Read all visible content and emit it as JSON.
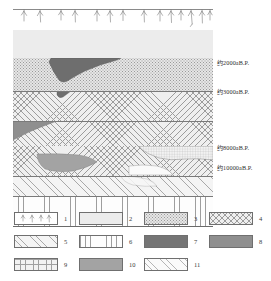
{
  "diagram": {
    "title": "",
    "type": "geological-stratigraphic-cross-section",
    "horizon_labels": [
      {
        "id": "h2000",
        "text": "约2000aB.P.",
        "top": 61
      },
      {
        "id": "h3000",
        "text": "约3000aB.P.",
        "top": 90
      },
      {
        "id": "h8000",
        "text": "约8000aB.P.",
        "top": 146
      },
      {
        "id": "h10000",
        "text": "约10000aB.P.",
        "top": 166
      }
    ],
    "surface": {
      "name": "vegetation-surface-line",
      "symbol_count": 14
    },
    "layers": [
      {
        "id": "L1",
        "pattern": "plain",
        "top": 0,
        "height": 28,
        "label": "2"
      },
      {
        "id": "L2",
        "pattern": "stipple",
        "top": 28,
        "height": 33,
        "label": "3"
      },
      {
        "id": "L3",
        "pattern": "xhatch",
        "top": 61,
        "height": 30,
        "label": "4"
      },
      {
        "id": "L4",
        "pattern": "xhatch",
        "top": 91,
        "height": 25,
        "label": "4"
      },
      {
        "id": "L5",
        "pattern": "xhatch",
        "top": 116,
        "height": 30,
        "label": "4"
      },
      {
        "id": "L6",
        "pattern": "dhatch",
        "top": 146,
        "height": 20,
        "label": "5"
      },
      {
        "id": "L7",
        "pattern": "vline",
        "top": 166,
        "height": 30,
        "label": "6"
      }
    ],
    "bodies": [
      {
        "id": "B1",
        "pattern": "solid-dark",
        "note": "dark lens in stipple layer"
      },
      {
        "id": "B2",
        "pattern": "solid-med",
        "note": "wedge at left of xhatch layer"
      },
      {
        "id": "B3",
        "pattern": "grid",
        "note": "grid lens at right"
      },
      {
        "id": "B4",
        "pattern": "solid-mg",
        "note": "gray lens lower left"
      },
      {
        "id": "B5",
        "pattern": "dhatch-light",
        "note": "hatched lens lower right"
      }
    ]
  },
  "legend": {
    "items": [
      {
        "num": "1",
        "pattern": "vegetation",
        "name": "legend-vegetation"
      },
      {
        "num": "2",
        "pattern": "plain",
        "name": "legend-plain"
      },
      {
        "num": "3",
        "pattern": "stipple",
        "name": "legend-stipple"
      },
      {
        "num": "4",
        "pattern": "xhatch",
        "name": "legend-crosshatch"
      },
      {
        "num": "5",
        "pattern": "dhatch",
        "name": "legend-diagonal-hatch"
      },
      {
        "num": "6",
        "pattern": "vline",
        "name": "legend-vertical-lines"
      },
      {
        "num": "7",
        "pattern": "solid-dark",
        "name": "legend-solid-dark"
      },
      {
        "num": "8",
        "pattern": "solid-med",
        "name": "legend-solid-medium"
      },
      {
        "num": "9",
        "pattern": "grid",
        "name": "legend-grid"
      },
      {
        "num": "10",
        "pattern": "solid-mg",
        "name": "legend-solid-gray"
      },
      {
        "num": "11",
        "pattern": "dhatch-light",
        "name": "legend-light-hatch"
      }
    ]
  }
}
